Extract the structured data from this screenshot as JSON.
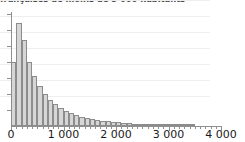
{
  "chart_data": {
    "type": "bar",
    "title": "françaises de moins de 5 000 habitants",
    "title_clipped": true,
    "xlabel": "",
    "ylabel": "",
    "xlim": [
      0,
      4000
    ],
    "ylim": [
      0,
      1400
    ],
    "grid": true,
    "legend": false,
    "bin_width": 100,
    "xtick_labels": [
      "0",
      "1 000",
      "2 000",
      "3 000",
      "4 000"
    ],
    "xtick_values": [
      0,
      1000,
      2000,
      3000,
      4000
    ],
    "ytick_labels": [
      "",
      "",
      "",
      "",
      "",
      "",
      ""
    ],
    "ytick_count": 7,
    "categories": [
      "0-100",
      "100-200",
      "200-300",
      "300-400",
      "400-500",
      "500-600",
      "600-700",
      "700-800",
      "800-900",
      "900-1000",
      "1000-1100",
      "1100-1200",
      "1200-1300",
      "1300-1400",
      "1400-1500",
      "1500-1600",
      "1600-1700",
      "1700-1800",
      "1800-1900",
      "1900-2000",
      "2000-2100",
      "2100-2200",
      "2200-2300",
      "2300-2400",
      "2400-2500",
      "2500-2600",
      "2600-2700",
      "2700-2800",
      "2800-2900",
      "2900-3000",
      "3000-3100",
      "3100-3200",
      "3200-3300",
      "3300-3400",
      "3400-3500",
      "3500-3600",
      "3600-3700",
      "3700-3800",
      "3800-3900",
      "3900-4000"
    ],
    "x": [
      50,
      150,
      250,
      350,
      450,
      550,
      650,
      750,
      850,
      950,
      1050,
      1150,
      1250,
      1350,
      1450,
      1550,
      1650,
      1750,
      1850,
      1950,
      2050,
      2150,
      2250,
      2350,
      2450,
      2550,
      2650,
      2750,
      2850,
      2950,
      3050,
      3150,
      3250,
      3350,
      3450,
      3550,
      3650,
      3750,
      3850,
      3950
    ],
    "values": [
      800,
      1290,
      1075,
      800,
      620,
      500,
      400,
      330,
      270,
      225,
      190,
      160,
      135,
      115,
      100,
      88,
      76,
      66,
      58,
      51,
      45,
      40,
      35,
      31,
      27,
      24,
      21,
      18,
      16,
      14,
      12,
      10,
      9,
      8,
      6,
      0,
      0,
      0,
      0,
      0
    ],
    "colors": {
      "bar_fill": "#d6d6d6",
      "bar_stroke": "#8c8c8c",
      "axis": "#8f8f8f",
      "grid": "#eeeeee",
      "tick_label": "#1a1a1a",
      "title": "#4a4a4a"
    }
  }
}
